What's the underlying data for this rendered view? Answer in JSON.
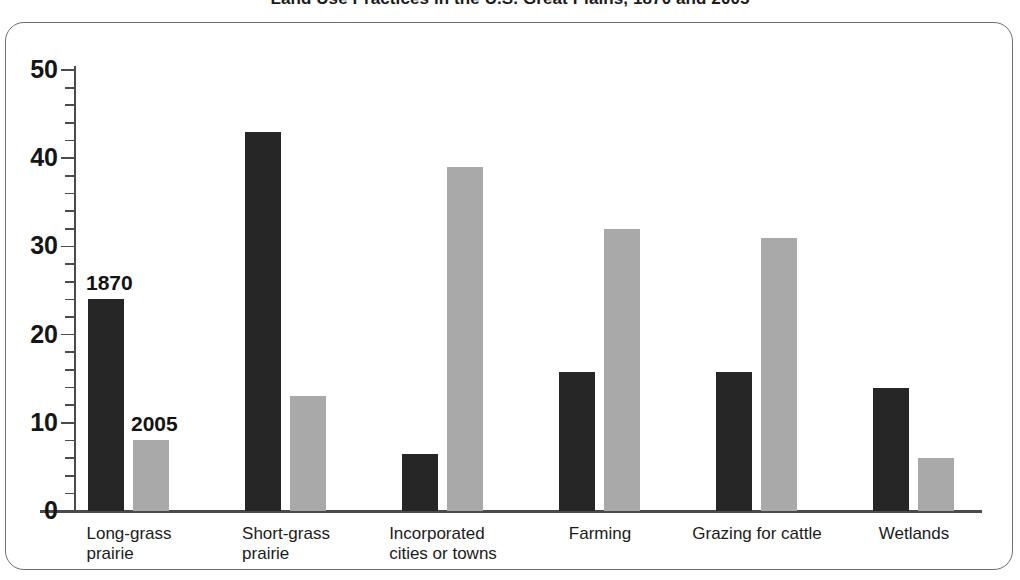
{
  "chart_data": {
    "type": "bar",
    "title": "Land Use Practices in the U.S. Great Plains, 1870 and 2005",
    "xlabel": "",
    "ylabel": "",
    "ylim": [
      0,
      50
    ],
    "yticks": [
      0,
      10,
      20,
      30,
      40,
      50
    ],
    "ytick_labels": [
      "0",
      "10",
      "20",
      "30",
      "40",
      "50"
    ],
    "minor_tick_step": 2,
    "grid": false,
    "legend_position": "inline-annotation",
    "categories": [
      "Long-grass prairie",
      "Short-grass prairie",
      "Incorporated cities or towns",
      "Farming",
      "Grazing for cattle",
      "Wetlands"
    ],
    "category_label_lines": [
      [
        "Long-grass",
        "prairie"
      ],
      [
        "Short-grass",
        "prairie"
      ],
      [
        "Incorporated",
        "cities or towns"
      ],
      [
        "Farming",
        ""
      ],
      [
        "Grazing for cattle",
        ""
      ],
      [
        "Wetlands",
        ""
      ]
    ],
    "series": [
      {
        "name": "1870",
        "color": "#262626",
        "values": [
          24,
          43,
          6.5,
          15.8,
          15.8,
          14
        ]
      },
      {
        "name": "2005",
        "color": "#a9a9a9",
        "values": [
          8,
          13,
          39,
          32,
          31,
          6
        ]
      }
    ],
    "annotations": [
      {
        "text": "1870",
        "series": "1870",
        "category": "Long-grass prairie"
      },
      {
        "text": "2005",
        "series": "2005",
        "category": "Long-grass prairie"
      }
    ]
  },
  "colors": {
    "series_1870": "#262626",
    "series_2005": "#a9a9a9",
    "axis": "#4b4b4b",
    "frame": "#6e6e6e",
    "text": "#1b1b1b",
    "background": "#ffffff"
  }
}
